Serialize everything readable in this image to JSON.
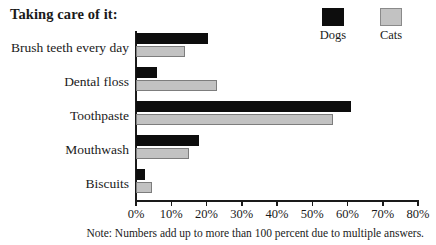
{
  "chart_data": {
    "type": "bar",
    "orientation": "horizontal",
    "title": "Taking care of it:",
    "xlabel": "",
    "ylabel": "",
    "xlim": [
      0,
      80
    ],
    "xtick_labels": [
      "0%",
      "10%",
      "20%",
      "30%",
      "40%",
      "50%",
      "60%",
      "70%",
      "80%"
    ],
    "xticks": [
      0,
      10,
      20,
      30,
      40,
      50,
      60,
      70,
      80
    ],
    "grid": false,
    "legend_position": "top-right",
    "categories": [
      "Brush teeth every day",
      "Dental floss",
      "Toothpaste",
      "Mouthwash",
      "Biscuits"
    ],
    "series": [
      {
        "name": "Dogs",
        "color": "#0d0d0d",
        "values": [
          20.5,
          6,
          61,
          18,
          2.5
        ]
      },
      {
        "name": "Cats",
        "color": "#c2c2c2",
        "values": [
          14,
          23,
          56,
          15,
          4.5
        ]
      }
    ],
    "note": "Note: Numbers add up to more than 100 percent due to multiple answers."
  },
  "legend": {
    "items": [
      {
        "label": "Dogs",
        "swatch": "black-square-swatch"
      },
      {
        "label": "Cats",
        "swatch": "gray-square-swatch"
      }
    ]
  }
}
